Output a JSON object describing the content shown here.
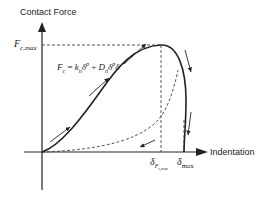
{
  "diagram": {
    "y_axis_label": "Contact Force",
    "x_axis_label": "Indentation",
    "y_tick": {
      "main": "F",
      "sub": "c,max"
    },
    "x_ticks": [
      {
        "main": "δ",
        "sub": "F",
        "subsub": "c,max"
      },
      {
        "main": "δ",
        "sub": "max"
      }
    ],
    "equation": {
      "lhs": "F",
      "lhs_sub": "c",
      "eq": " = ",
      "k": "k",
      "k_sub": "n",
      "delta": "δ",
      "exp": "p",
      "plus": " + ",
      "D": "D",
      "D_sub": "n",
      "delta2": "δ",
      "exp2": "p",
      "deltadot": "δ̇"
    },
    "colors": {
      "curve": "#222222",
      "axis": "#222222",
      "dashed": "#444444",
      "text": "#222222"
    }
  }
}
